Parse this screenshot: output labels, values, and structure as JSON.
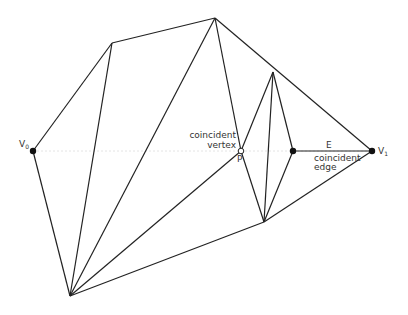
{
  "diagram": {
    "type": "triangulation",
    "colors": {
      "edge": "#222222",
      "guide": "#dddddd",
      "label": "#333333",
      "background": "#ffffff"
    },
    "vertices": {
      "V0": [
        33,
        151
      ],
      "A": [
        112,
        43
      ],
      "T": [
        215,
        18
      ],
      "B": [
        273,
        72
      ],
      "P": [
        241,
        151
      ],
      "Q": [
        293,
        151
      ],
      "V1": [
        372,
        151
      ],
      "C": [
        264,
        222
      ],
      "Bot": [
        70,
        296
      ]
    },
    "labels": {
      "v0_main": "V",
      "v0_sub": "0",
      "v1_main": "V",
      "v1_sub": "1",
      "coincident_vertex_line1": "coincident",
      "coincident_vertex_line2": "vertex",
      "p": "P",
      "e": "E",
      "coincident_edge_line1": "coincident",
      "coincident_edge_line2": "edge"
    }
  }
}
